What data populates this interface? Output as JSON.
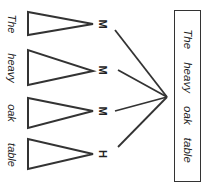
{
  "diagram": {
    "type": "syntactic-tree-rotated",
    "colors": {
      "stroke": "#333333",
      "text": "#222222",
      "background": "#ffffff"
    },
    "words": [
      {
        "label": "The",
        "tag": "M",
        "tri": {
          "top": 12,
          "bottom": 35,
          "apex_y": 24
        },
        "label_y": 24,
        "tag_y": 24
      },
      {
        "label": "heavy",
        "tag": "M",
        "tri": {
          "top": 50,
          "bottom": 85,
          "apex_y": 71
        },
        "label_y": 68,
        "tag_y": 70
      },
      {
        "label": "oak",
        "tag": "M",
        "tri": {
          "top": 98,
          "bottom": 128,
          "apex_y": 111
        },
        "label_y": 113,
        "tag_y": 111
      },
      {
        "label": "table",
        "tag": "H",
        "tri": {
          "top": 139,
          "bottom": 169,
          "apex_y": 154
        },
        "label_y": 155,
        "tag_y": 154
      }
    ],
    "junction": {
      "x": 167,
      "y": 97
    },
    "sentence": "The heavy oak table"
  }
}
